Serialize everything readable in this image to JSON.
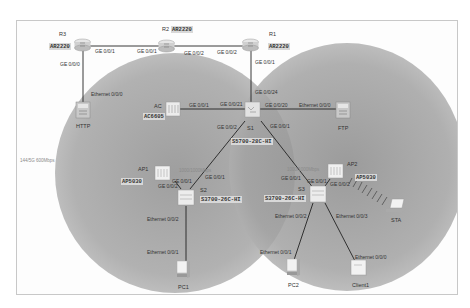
{
  "diagram": {
    "type": "network-topology",
    "wlan_rate_label": "144/5G 600Mbps",
    "ap1_link_rate": "1000/1000Mbps",
    "ap2_link_rate": "1000/1000Mbps",
    "devices": {
      "R1": {
        "name": "R1",
        "model": "AR2220"
      },
      "R2": {
        "name": "R2",
        "model": "AR2220"
      },
      "R3": {
        "name": "R3",
        "model": "AR2220"
      },
      "HTTP": {
        "name": "HTTP"
      },
      "FTP": {
        "name": "FTP"
      },
      "AC": {
        "name": "AC",
        "model": "AC6605"
      },
      "S1": {
        "name": "S1",
        "model": "S5700-28C-HI"
      },
      "S2": {
        "name": "S2",
        "model": "S3700-26C-HI"
      },
      "S3": {
        "name": "S3",
        "model": "S3700-26C-HI"
      },
      "AP1": {
        "name": "AP1",
        "model": "AP5030"
      },
      "AP2": {
        "name": "AP2",
        "model": "AP5030"
      },
      "PC1": {
        "name": "PC1"
      },
      "PC2": {
        "name": "PC2"
      },
      "Client1": {
        "name": "Client1"
      },
      "STA": {
        "name": "STA"
      }
    },
    "ports": {
      "r3_ge001": "GE 0/0/1",
      "r3_ge000": "GE 0/0/0",
      "r2_ge001": "GE 0/0/1",
      "r2_ge002": "GE 0/0/2",
      "r1_ge002": "GE 0/0/2",
      "r1_ge001": "GE 0/0/1",
      "http_eth": "Ethernet 0/0/0",
      "s1_ge0024": "GE 0/0/24",
      "s1_ge0021": "GE 0/0/21",
      "s1_ge0020": "GE 0/0/20",
      "s1_ge002": "GE 0/0/2",
      "s1_ge001": "GE 0/0/1",
      "ac_ge001": "GE 0/0/1",
      "ftp_eth": "Ethernet 0/0/0",
      "ap1_ge001": "GE 0/0/1",
      "s2_ge002": "GE 0/0/2",
      "s2_ge001": "GE 0/0/1",
      "s2_eth002": "Ethernet 0/0/2",
      "pc1_eth": "Ethernet 0/0/1",
      "ap2_ge001": "GE 0/0/1",
      "s3_ge001": "GE 0/0/1",
      "s3_ge002": "GE 0/0/2",
      "s3_eth002": "Ethernet 0/0/2",
      "s3_eth003": "Ethernet 0/0/3",
      "pc2_eth": "Ethernet 0/0/1",
      "client1_eth": "Ethernet 0/0/0"
    }
  }
}
